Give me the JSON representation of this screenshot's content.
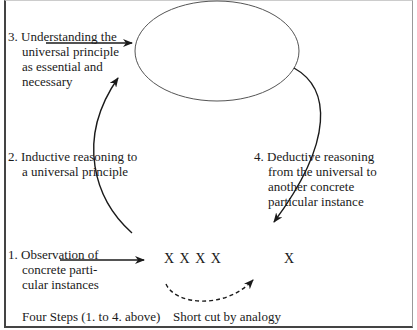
{
  "step3": {
    "line1": "3.  Understanding the",
    "line2": "universal principle",
    "line3": "as essential and",
    "line4": "necessary"
  },
  "step2": {
    "line1": "2. Inductive reasoning to",
    "line2": "a universal principle"
  },
  "step4": {
    "line1": "4. Deductive reasoning",
    "line2": "from the universal to",
    "line3": "another concrete",
    "line4": "particular instance"
  },
  "step1": {
    "line1": "1.  Observation of",
    "line2": "concrete parti-",
    "line3": "cular instances"
  },
  "instances": {
    "group": "X X X X",
    "single": "X"
  },
  "footer": {
    "left": "Four Steps (1. to 4. above)",
    "right": "Short cut by analogy"
  },
  "colors": {
    "line": "#1a1a1a",
    "ellipse": "#555555"
  }
}
